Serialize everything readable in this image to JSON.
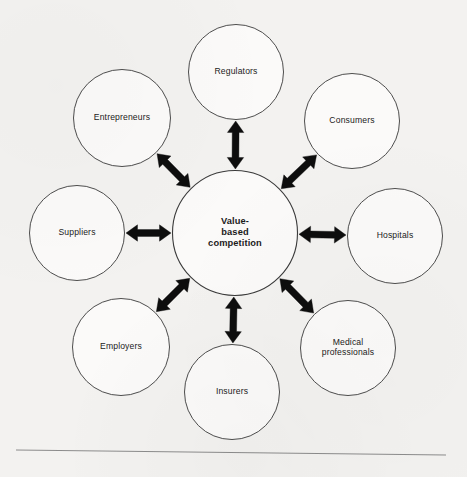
{
  "figure": {
    "type": "hub-and-spoke-diagram",
    "hub": {
      "id": "value-based-competition",
      "label_lines": [
        "Value-",
        "based",
        "competition"
      ],
      "label": "Value-based competition",
      "cx": 235,
      "cy": 233,
      "r": 62.5
    },
    "nodes": [
      {
        "id": "regulators",
        "label": "Regulators",
        "label_lines": [
          "Regulators"
        ],
        "cx": 236,
        "cy": 72,
        "r": 47.5,
        "angle_deg": 270
      },
      {
        "id": "consumers",
        "label": "Consumers",
        "label_lines": [
          "Consumers"
        ],
        "cx": 352,
        "cy": 121,
        "r": 47.5,
        "angle_deg": 315
      },
      {
        "id": "hospitals",
        "label": "Hospitals",
        "label_lines": [
          "Hospitals"
        ],
        "cx": 395,
        "cy": 236,
        "r": 47.5,
        "angle_deg": 0
      },
      {
        "id": "medical-professionals",
        "label": "Medical professionals",
        "label_lines": [
          "Medical",
          "professionals"
        ],
        "cx": 348,
        "cy": 348,
        "r": 47.5,
        "angle_deg": 45
      },
      {
        "id": "insurers",
        "label": "Insurers",
        "label_lines": [
          "Insurers"
        ],
        "cx": 232,
        "cy": 392,
        "r": 47.5,
        "angle_deg": 90
      },
      {
        "id": "employers",
        "label": "Employers",
        "label_lines": [
          "Employers"
        ],
        "cx": 121,
        "cy": 347,
        "r": 48.5,
        "angle_deg": 135
      },
      {
        "id": "suppliers",
        "label": "Suppliers",
        "label_lines": [
          "Suppliers"
        ],
        "cx": 77,
        "cy": 233,
        "r": 47.5,
        "angle_deg": 180
      },
      {
        "id": "entrepreneurs",
        "label": "Entrepreneurs",
        "label_lines": [
          "Entrepreneurs"
        ],
        "cx": 122,
        "cy": 118,
        "r": 48.5,
        "angle_deg": 225
      }
    ],
    "connectors": [
      {
        "id": "hub-regulators",
        "from": "value-based-competition",
        "to": "regulators",
        "arrowheads": "both"
      },
      {
        "id": "hub-consumers",
        "from": "value-based-competition",
        "to": "consumers",
        "arrowheads": "both"
      },
      {
        "id": "hub-hospitals",
        "from": "value-based-competition",
        "to": "hospitals",
        "arrowheads": "both"
      },
      {
        "id": "hub-medical-professionals",
        "from": "value-based-competition",
        "to": "medical-professionals",
        "arrowheads": "both"
      },
      {
        "id": "hub-insurers",
        "from": "value-based-competition",
        "to": "insurers",
        "arrowheads": "both"
      },
      {
        "id": "hub-employers",
        "from": "value-based-competition",
        "to": "employers",
        "arrowheads": "both"
      },
      {
        "id": "hub-suppliers",
        "from": "value-based-competition",
        "to": "suppliers",
        "arrowheads": "both"
      },
      {
        "id": "hub-entrepreneurs",
        "from": "value-based-competition",
        "to": "entrepreneurs",
        "arrowheads": "both"
      }
    ],
    "footer_rule": {
      "x1": 16,
      "y1": 450,
      "x2": 446,
      "y2": 455
    },
    "colors": {
      "page_background": "#f3f2f0",
      "circle_fill": "#fbfaf9",
      "circle_stroke": "#3a3a3a",
      "arrow": "#0d0d0d",
      "text": "#1b1b1b",
      "rule": "#8c8c8c"
    }
  }
}
